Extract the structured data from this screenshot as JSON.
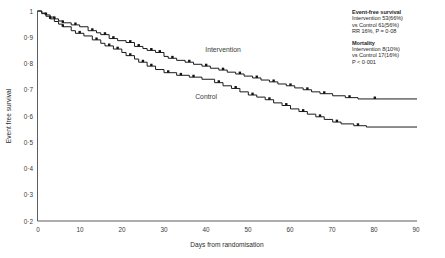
{
  "chart_data": {
    "type": "line",
    "subtype": "kaplan-meier-step",
    "title": "",
    "xlabel": "Days from randomisation",
    "ylabel": "Event free survival",
    "xlim": [
      0,
      90
    ],
    "ylim": [
      0.2,
      1.0
    ],
    "xticks": [
      0,
      10,
      20,
      30,
      40,
      50,
      60,
      70,
      80,
      90
    ],
    "xtick_labels": [
      "0",
      "10",
      "20",
      "30",
      "40",
      "50",
      "60",
      "70",
      "80",
      "90"
    ],
    "yticks": [
      0.2,
      0.3,
      0.4,
      0.5,
      0.6,
      0.7,
      0.8,
      0.9,
      1.0
    ],
    "ytick_labels": [
      "0·2",
      "0·3",
      "0·4",
      "0·5",
      "0·6",
      "0·7",
      "0·8",
      "0·9",
      "1"
    ],
    "grid": false,
    "legend_position": "inline-curve-labels",
    "series": [
      {
        "name": "Intervention",
        "label_x": 44,
        "label_y": 0.845,
        "points": [
          [
            0,
            1.0
          ],
          [
            1,
            0.992
          ],
          [
            2,
            0.985
          ],
          [
            3,
            0.977
          ],
          [
            4,
            0.97
          ],
          [
            5,
            0.962
          ],
          [
            6,
            0.955
          ],
          [
            8,
            0.947
          ],
          [
            10,
            0.94
          ],
          [
            12,
            0.925
          ],
          [
            14,
            0.917
          ],
          [
            15,
            0.91
          ],
          [
            17,
            0.895
          ],
          [
            19,
            0.887
          ],
          [
            21,
            0.88
          ],
          [
            23,
            0.865
          ],
          [
            25,
            0.857
          ],
          [
            26,
            0.85
          ],
          [
            28,
            0.842
          ],
          [
            30,
            0.827
          ],
          [
            31,
            0.82
          ],
          [
            33,
            0.812
          ],
          [
            35,
            0.805
          ],
          [
            37,
            0.797
          ],
          [
            39,
            0.79
          ],
          [
            41,
            0.782
          ],
          [
            43,
            0.775
          ],
          [
            45,
            0.767
          ],
          [
            47,
            0.76
          ],
          [
            49,
            0.752
          ],
          [
            51,
            0.745
          ],
          [
            53,
            0.737
          ],
          [
            55,
            0.73
          ],
          [
            57,
            0.722
          ],
          [
            59,
            0.715
          ],
          [
            61,
            0.707
          ],
          [
            63,
            0.7
          ],
          [
            65,
            0.692
          ],
          [
            67,
            0.685
          ],
          [
            70,
            0.677
          ],
          [
            73,
            0.67
          ],
          [
            76,
            0.665
          ],
          [
            90,
            0.665
          ]
        ],
        "censored_x": [
          2,
          4,
          6,
          9,
          13,
          16,
          18,
          22,
          24,
          27,
          29,
          32,
          36,
          40,
          44,
          48,
          52,
          56,
          60,
          64,
          68,
          74,
          80
        ]
      },
      {
        "name": "Control",
        "label_x": 40,
        "label_y": 0.665,
        "points": [
          [
            0,
            1.0
          ],
          [
            1,
            0.99
          ],
          [
            2,
            0.98
          ],
          [
            3,
            0.97
          ],
          [
            4,
            0.96
          ],
          [
            5,
            0.95
          ],
          [
            6,
            0.94
          ],
          [
            8,
            0.925
          ],
          [
            9,
            0.915
          ],
          [
            11,
            0.905
          ],
          [
            13,
            0.89
          ],
          [
            15,
            0.877
          ],
          [
            16,
            0.867
          ],
          [
            18,
            0.855
          ],
          [
            20,
            0.842
          ],
          [
            21,
            0.83
          ],
          [
            23,
            0.817
          ],
          [
            24,
            0.805
          ],
          [
            26,
            0.79
          ],
          [
            28,
            0.777
          ],
          [
            30,
            0.765
          ],
          [
            33,
            0.755
          ],
          [
            36,
            0.748
          ],
          [
            39,
            0.74
          ],
          [
            42,
            0.727
          ],
          [
            44,
            0.715
          ],
          [
            46,
            0.705
          ],
          [
            48,
            0.692
          ],
          [
            50,
            0.68
          ],
          [
            52,
            0.672
          ],
          [
            54,
            0.662
          ],
          [
            56,
            0.65
          ],
          [
            58,
            0.64
          ],
          [
            60,
            0.627
          ],
          [
            62,
            0.617
          ],
          [
            64,
            0.607
          ],
          [
            66,
            0.597
          ],
          [
            68,
            0.587
          ],
          [
            70,
            0.577
          ],
          [
            72,
            0.57
          ],
          [
            75,
            0.563
          ],
          [
            78,
            0.558
          ],
          [
            90,
            0.558
          ]
        ],
        "censored_x": [
          3,
          6,
          10,
          14,
          17,
          19,
          22,
          25,
          27,
          31,
          34,
          37,
          43,
          47,
          51,
          55,
          59,
          63,
          67,
          71,
          76
        ]
      }
    ]
  },
  "annotations": {
    "event_free": {
      "heading": "Event-free survival",
      "line1": "Intervention 53(66%)",
      "line2": "vs Control 61(56%)",
      "line3": "RR 16%, P = 0·08"
    },
    "mortality": {
      "heading": "Mortality",
      "line1": "Intervention 8(10%)",
      "line2": "vs Control 17(16%)",
      "line3": "P < 0·001"
    }
  }
}
